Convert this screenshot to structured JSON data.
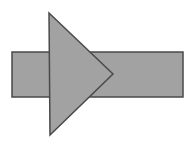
{
  "canvas": {
    "width": 192,
    "height": 148,
    "background_color": "#ffffff",
    "title": "Overlapping rectangle and triangle"
  },
  "style": {
    "fill_color": "#a2a2a2",
    "stroke_color": "#4a4a4a",
    "stroke_width": 1.5
  },
  "shapes": [
    {
      "id": "rectangle",
      "name": "horizontal-rectangle",
      "type": "rect",
      "x": 12,
      "y": 52,
      "width": 171,
      "height": 45,
      "fill_color": "#a2a2a2",
      "stroke_color": "#4a4a4a"
    },
    {
      "id": "triangle",
      "name": "left-pointing-triangle",
      "type": "polygon",
      "points": "49,13 113,74 50,135",
      "vertices": [
        {
          "x": 49,
          "y": 13
        },
        {
          "x": 113,
          "y": 74
        },
        {
          "x": 50,
          "y": 135
        }
      ],
      "fill_color": "#a2a2a2",
      "stroke_color": "#4a4a4a"
    }
  ]
}
